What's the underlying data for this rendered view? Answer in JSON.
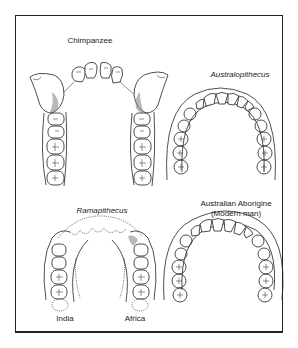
{
  "figure": {
    "panels": [
      {
        "id": "chimpanzee",
        "label": "Chimpanzee",
        "style": "normal"
      },
      {
        "id": "australopithecus",
        "label": "Australopithecus",
        "style": "italic"
      },
      {
        "id": "ramapithecus",
        "label": "Ramapithecus",
        "style": "italic",
        "sublabels": {
          "left": "India",
          "right": "Africa"
        }
      },
      {
        "id": "aborigine",
        "label": "Australian Aborigine",
        "sublabel": "(Modern man)",
        "style": "normal"
      }
    ],
    "colors": {
      "ink": "#222222",
      "background": "#ffffff"
    }
  }
}
